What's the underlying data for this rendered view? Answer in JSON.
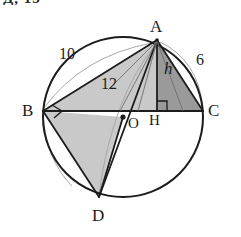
{
  "figure": {
    "kind": "circle-geometry-diagram",
    "top_cropped_caption": "Д, 15",
    "colors": {
      "stroke": "#1c1c1c",
      "background": "#ffffff",
      "fill_light": "#c9c9c9",
      "fill_mid": "#bdbdbd",
      "fill_dark": "#9a9a9a",
      "arc_faint": "#9f9f9f"
    },
    "vertex_labels": [
      {
        "name": "A",
        "text": "A",
        "x": 150,
        "y": 18
      },
      {
        "name": "B",
        "text": "B",
        "x": 22,
        "y": 102
      },
      {
        "name": "C",
        "text": "C",
        "x": 208,
        "y": 102
      },
      {
        "name": "D",
        "text": "D",
        "x": 92,
        "y": 210
      }
    ],
    "point_labels": [
      {
        "name": "O",
        "text": "O",
        "x": 128,
        "y": 117
      },
      {
        "name": "H",
        "text": "H",
        "x": 150,
        "y": 117
      }
    ],
    "measure_labels": [
      {
        "name": "side-ab-length",
        "text": "10",
        "x": 59,
        "y": 48,
        "italic": false
      },
      {
        "name": "side-ac-length",
        "text": "6",
        "x": 196,
        "y": 54,
        "italic": false
      },
      {
        "name": "chord-bd-length",
        "text": "12",
        "x": 101,
        "y": 76,
        "italic": false
      },
      {
        "name": "altitude-h",
        "text": "h",
        "x": 163,
        "y": 62,
        "italic": true
      }
    ],
    "geometry": {
      "circle": {
        "cx": 123,
        "cy": 117,
        "r": 80
      },
      "points": {
        "A": {
          "x": 157,
          "y": 40
        },
        "B": {
          "x": 43,
          "y": 111
        },
        "C": {
          "x": 203,
          "y": 111
        },
        "D": {
          "x": 99,
          "y": 197
        },
        "O": {
          "x": 123,
          "y": 117
        },
        "H": {
          "x": 157,
          "y": 111
        }
      },
      "segments": [
        {
          "name": "segment-bc",
          "from": "B",
          "to": "C"
        },
        {
          "name": "segment-ab",
          "from": "A",
          "to": "B"
        },
        {
          "name": "segment-ac",
          "from": "A",
          "to": "C"
        },
        {
          "name": "segment-ah",
          "from": "A",
          "to": "H"
        },
        {
          "name": "segment-ad",
          "from": "A",
          "to": "D"
        },
        {
          "name": "segment-bd",
          "from": "B",
          "to": "D"
        },
        {
          "name": "segment-cd",
          "from": "C",
          "to": "D"
        }
      ],
      "right_angles": [
        {
          "name": "right-angle-at-b",
          "vertex": "B"
        },
        {
          "name": "right-angle-at-h",
          "vertex": "H"
        }
      ],
      "shaded_regions": [
        {
          "name": "triangle-abh",
          "vertices": [
            "A",
            "B",
            "H"
          ],
          "tone": "fill_light"
        },
        {
          "name": "triangle-ahc",
          "vertices": [
            "A",
            "H",
            "C"
          ],
          "tone": "fill_dark"
        },
        {
          "name": "triangle-bod",
          "vertices": [
            "B",
            "O",
            "D"
          ],
          "tone": "fill_light"
        }
      ]
    }
  }
}
